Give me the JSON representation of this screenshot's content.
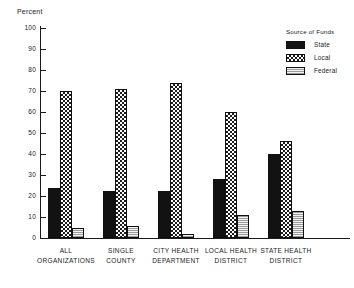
{
  "chart_data": {
    "type": "bar",
    "title": "",
    "xlabel": "",
    "ylabel": "Percent",
    "ylim": [
      0,
      100
    ],
    "ytick_step": 10,
    "yticks": [
      100,
      90,
      80,
      70,
      60,
      50,
      40,
      30,
      20,
      10,
      0
    ],
    "grid": false,
    "legend_position": "top-right",
    "legend_title": "Source of Funds",
    "categories": [
      "ALL ORGANIZATIONS",
      "SINGLE COUNTY",
      "CITY HEALTH DEPARTMENT",
      "LOCAL HEALTH DISTRICT",
      "STATE HEALTH DISTRICT"
    ],
    "category_lines": [
      [
        "ALL",
        "ORGANIZATIONS"
      ],
      [
        "SINGLE",
        "COUNTY"
      ],
      [
        "CITY HEALTH",
        "DEPARTMENT"
      ],
      [
        "LOCAL HEALTH",
        "DISTRICT"
      ],
      [
        "STATE HEALTH",
        "DISTRICT"
      ]
    ],
    "series": [
      {
        "name": "State",
        "pattern": "dark-speckle",
        "values": [
          24,
          22.5,
          22.5,
          28,
          40
        ]
      },
      {
        "name": "Local",
        "pattern": "checker",
        "values": [
          70,
          71,
          74,
          60,
          46
        ]
      },
      {
        "name": "Federal",
        "pattern": "light-hatch",
        "values": [
          5,
          5.5,
          2,
          11,
          13
        ]
      }
    ]
  },
  "colors": {
    "axis": "#1a1a1a",
    "state": "#121212",
    "local": "#1c1c1c",
    "federal": "#f2f2f2",
    "background": "#ffffff"
  }
}
